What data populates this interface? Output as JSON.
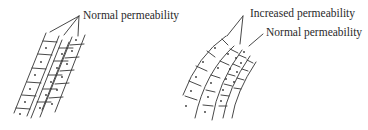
{
  "figure": {
    "left_panel": {
      "label": "Normal permeability",
      "description": "straight layer of cells, three columns"
    },
    "right_panel": {
      "labels": {
        "increased": "Increased permeability",
        "normal": "Normal permeability"
      },
      "description": "curved layer of cells, outer layers compressed"
    }
  },
  "colors": {
    "ink": "#333333",
    "background": "#ffffff"
  }
}
